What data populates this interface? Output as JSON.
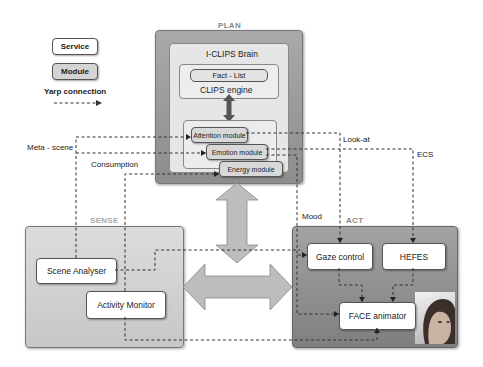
{
  "legend": {
    "service_label": "Service",
    "module_label": "Module",
    "connection_label": "Yarp connection",
    "connection_icon": "dashed-arrow"
  },
  "plan": {
    "title": "PLAN",
    "brain_title": "I-CLIPS Brain",
    "fact_list": "Fact - List",
    "engine": "CLIPS engine",
    "modules": [
      "Attention module",
      "Emotion module",
      "Energy module"
    ]
  },
  "sense": {
    "title": "SENSE",
    "services": [
      "Scene Analyser",
      "Activity Monitor"
    ]
  },
  "act": {
    "title": "ACT",
    "services": [
      "Gaze control",
      "HEFES",
      "FACE animator"
    ],
    "image": "android-face-photo"
  },
  "connections": {
    "meta_scene": "Meta - scene",
    "consumption": "Consumption",
    "look_at": "Look-at",
    "ecs": "ECS",
    "mood": "Mood"
  },
  "colors": {
    "plan_outer": "#9a9a9a",
    "plan_inner": "#e6e6e6",
    "sense_bg": "#d2d2d2",
    "act_bg": "#919191",
    "big_arrow": "#bdbdbd",
    "module_fill": "#d8d8d8",
    "service_fill": "#ffffff",
    "header_text": "#888888"
  }
}
